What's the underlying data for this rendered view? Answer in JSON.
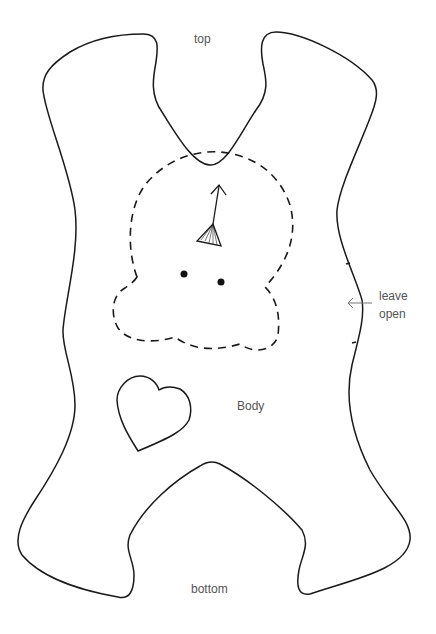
{
  "pattern": {
    "piece_name": "Body",
    "labels": {
      "top": "top",
      "body": "Body",
      "bottom": "bottom",
      "leave_open_line1": "leave",
      "leave_open_line2": "open"
    },
    "colors": {
      "outline": "#1a1a1a",
      "label_text": "#555555",
      "background": "#ffffff"
    },
    "elements": [
      {
        "type": "outline",
        "style": "solid",
        "description": "body cut line"
      },
      {
        "type": "placement",
        "style": "dashed",
        "description": "head placement outline"
      },
      {
        "type": "grainline-arrow",
        "description": "arrow with fan/dart base"
      },
      {
        "type": "eyes",
        "count": 2
      },
      {
        "type": "heart",
        "style": "solid"
      },
      {
        "type": "opening-marks",
        "count": 2,
        "label": "leave open"
      }
    ]
  }
}
